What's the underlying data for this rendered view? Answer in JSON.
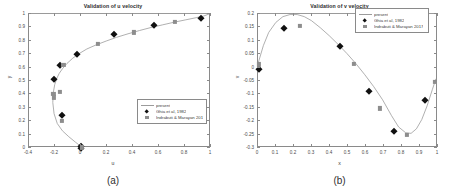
{
  "figure": {
    "panel_a_label": "(a)",
    "panel_b_label": "(b)"
  },
  "chart_data": [
    {
      "type": "scatter",
      "panel": "(a)",
      "title": "Validation of u velocity",
      "xlabel": "u",
      "ylabel": "y",
      "xlim": [
        -0.4,
        1
      ],
      "ylim": [
        0,
        1
      ],
      "xticks": [
        -0.4,
        -0.2,
        0,
        0.2,
        0.4,
        0.6,
        0.8,
        1
      ],
      "xticklabels": [
        "-0.4",
        "-0.2",
        "0",
        "0.2",
        "0.4",
        "0.6",
        "0.8",
        "1"
      ],
      "yticks": [
        0,
        0.1,
        0.2,
        0.3,
        0.4,
        0.5,
        0.6,
        0.7,
        0.8,
        0.9,
        1
      ],
      "yticklabels": [
        "0",
        "0.1",
        "0.2",
        "0.3",
        "0.4",
        "0.5",
        "0.6",
        "0.7",
        "0.8",
        "0.9",
        "1"
      ],
      "grid": false,
      "legend_position": "lower right",
      "series": [
        {
          "name": "present",
          "style": "line",
          "color": "#9b9b9b",
          "x": [
            0,
            -0.04,
            -0.09,
            -0.14,
            -0.18,
            -0.205,
            -0.215,
            -0.21,
            -0.2,
            -0.185,
            -0.165,
            -0.14,
            -0.105,
            -0.06,
            -0.01,
            0.05,
            0.12,
            0.2,
            0.28,
            0.37,
            0.46,
            0.55,
            0.64,
            0.73,
            0.82,
            0.9,
            0.96,
            1
          ],
          "y": [
            0,
            0.03,
            0.07,
            0.115,
            0.17,
            0.245,
            0.33,
            0.41,
            0.465,
            0.51,
            0.55,
            0.585,
            0.625,
            0.665,
            0.7,
            0.735,
            0.765,
            0.795,
            0.823,
            0.85,
            0.875,
            0.898,
            0.918,
            0.938,
            0.956,
            0.972,
            0.985,
            1
          ]
        },
        {
          "name": "Ghia et al, 1982",
          "style": "marker-diamond",
          "color": "#101010",
          "x": [
            0,
            0,
            -0.145,
            -0.205,
            -0.16,
            -0.03,
            0.25,
            0.565,
            0.92
          ],
          "y": [
            0,
            0.012,
            0.245,
            0.512,
            0.617,
            0.702,
            0.849,
            0.921,
            0.972
          ]
        },
        {
          "name": "Indrabuti & Marayan 2017",
          "style": "marker-square",
          "color": "#8d8d8d",
          "x": [
            0.005,
            -0.15,
            -0.21,
            -0.212,
            -0.165,
            -0.135,
            0.13,
            0.41,
            0.72
          ],
          "y": [
            0.005,
            0.2,
            0.378,
            0.405,
            0.418,
            0.62,
            0.778,
            0.862,
            0.942
          ]
        }
      ]
    },
    {
      "type": "scatter",
      "panel": "(b)",
      "title": "Validation of v velocity",
      "xlabel": "x",
      "ylabel": "v",
      "xlim": [
        0,
        1
      ],
      "ylim": [
        -0.3,
        0.2
      ],
      "xticks": [
        0,
        0.1,
        0.2,
        0.3,
        0.4,
        0.5,
        0.6,
        0.7,
        0.8,
        0.9,
        1
      ],
      "xticklabels": [
        "0",
        "0.1",
        "0.2",
        "0.3",
        "0.4",
        "0.5",
        "0.6",
        "0.7",
        "0.8",
        "0.9",
        "1"
      ],
      "yticks": [
        -0.3,
        -0.25,
        -0.2,
        -0.15,
        -0.1,
        -0.05,
        0,
        0.05,
        0.1,
        0.15,
        0.2
      ],
      "yticklabels": [
        "-0.3",
        "-0.25",
        "-0.2",
        "-0.15",
        "-0.1",
        "-0.05",
        "0",
        "0.05",
        "0.1",
        "0.15",
        "0.2"
      ],
      "grid": false,
      "legend_position": "upper right",
      "series": [
        {
          "name": "present",
          "style": "line",
          "color": "#9b9b9b",
          "x": [
            0,
            0.03,
            0.06,
            0.1,
            0.14,
            0.18,
            0.22,
            0.26,
            0.3,
            0.35,
            0.4,
            0.45,
            0.5,
            0.55,
            0.6,
            0.65,
            0.7,
            0.75,
            0.79,
            0.83,
            0.86,
            0.89,
            0.92,
            0.95,
            0.98,
            1
          ],
          "y": [
            0.012,
            0.08,
            0.13,
            0.168,
            0.19,
            0.198,
            0.198,
            0.19,
            0.175,
            0.148,
            0.118,
            0.085,
            0.05,
            0.012,
            -0.03,
            -0.075,
            -0.125,
            -0.185,
            -0.228,
            -0.25,
            -0.252,
            -0.235,
            -0.2,
            -0.148,
            -0.085,
            -0.045
          ]
        },
        {
          "name": "Ghia et al, 1982",
          "style": "marker-diamond",
          "color": "#101010",
          "x": [
            0.005,
            0.145,
            0.455,
            0.615,
            0.755,
            0.93
          ],
          "y": [
            -0.005,
            0.148,
            0.082,
            -0.086,
            -0.235,
            -0.122
          ]
        },
        {
          "name": "Indrabuti & Marayan 2017",
          "style": "marker-square",
          "color": "#8d8d8d",
          "x": [
            0.005,
            0.235,
            0.535,
            0.675,
            0.825,
            0.985
          ],
          "y": [
            0.012,
            0.155,
            0.015,
            -0.152,
            -0.252,
            -0.052
          ]
        }
      ]
    }
  ]
}
